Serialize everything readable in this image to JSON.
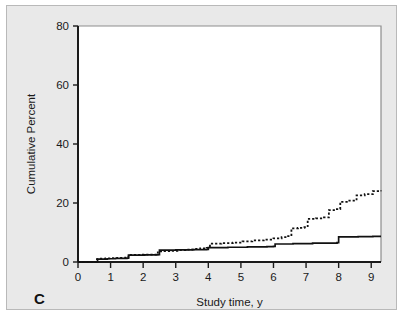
{
  "figure": {
    "panel_label": "C",
    "background_color": "#e9e9e9",
    "plot_background_color": "#ffffff",
    "border_color": "#b9b9b9"
  },
  "chart_data": {
    "type": "line",
    "title": "",
    "subtitle": "",
    "xlabel": "Study time, y",
    "ylabel": "Cumulative Percent",
    "xlim": [
      0,
      9.3
    ],
    "ylim": [
      0,
      80
    ],
    "xticks": [
      0,
      1,
      2,
      3,
      4,
      5,
      6,
      7,
      8,
      9
    ],
    "xticklabels": [
      "0",
      "1",
      "2",
      "3",
      "4",
      "5",
      "6",
      "7",
      "8",
      "9"
    ],
    "yticks": [
      0,
      20,
      40,
      60,
      80
    ],
    "yticklabels": [
      "0",
      "20",
      "40",
      "60",
      "80"
    ],
    "grid": false,
    "legend_position": "none",
    "annotations": [
      "C"
    ],
    "series": [
      {
        "name": "dotted-curve",
        "style": "dotted",
        "color": "#111111",
        "step": "post",
        "x": [
          0,
          0.45,
          0.55,
          0.7,
          0.85,
          1.0,
          1.2,
          1.45,
          1.55,
          1.95,
          2.45,
          2.6,
          2.8,
          3.05,
          3.3,
          3.55,
          3.75,
          3.95,
          4.05,
          4.4,
          4.75,
          5.05,
          5.35,
          5.7,
          6.0,
          6.25,
          6.45,
          6.55,
          6.75,
          6.95,
          7.05,
          7.3,
          7.55,
          7.7,
          7.9,
          8.05,
          8.25,
          8.55,
          8.8,
          9.05,
          9.3
        ],
        "y": [
          0,
          0,
          1.0,
          1.1,
          1.2,
          1.3,
          1.4,
          1.5,
          2.4,
          2.5,
          3.6,
          3.7,
          3.8,
          4.0,
          4.2,
          4.4,
          4.6,
          4.8,
          6.2,
          6.4,
          6.6,
          7.0,
          7.3,
          7.6,
          8.0,
          8.4,
          8.8,
          11.4,
          11.6,
          11.8,
          14.6,
          14.8,
          15.1,
          17.6,
          17.9,
          20.4,
          20.8,
          22.6,
          23.0,
          24.0,
          24.2
        ]
      },
      {
        "name": "solid-curve",
        "style": "solid",
        "color": "#111111",
        "step": "post",
        "x": [
          0,
          0.45,
          0.6,
          0.9,
          1.15,
          1.5,
          1.55,
          2.05,
          2.45,
          2.5,
          3.0,
          3.5,
          3.95,
          4.0,
          4.6,
          5.2,
          5.8,
          6.0,
          6.05,
          6.6,
          7.2,
          7.95,
          8.0,
          8.6,
          9.05,
          9.3
        ],
        "y": [
          0,
          0,
          1.0,
          1.1,
          1.2,
          1.3,
          2.3,
          2.4,
          2.5,
          4.0,
          4.1,
          4.2,
          4.3,
          4.9,
          5.0,
          5.1,
          5.2,
          5.3,
          6.1,
          6.2,
          6.4,
          6.6,
          8.5,
          8.6,
          8.7,
          8.7
        ]
      }
    ]
  }
}
